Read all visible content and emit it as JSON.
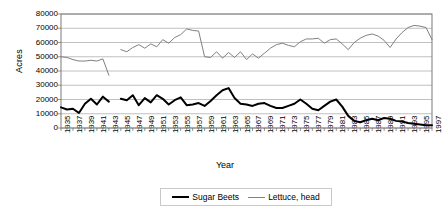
{
  "chart_data": {
    "type": "line",
    "title": "",
    "xlabel": "Year",
    "ylabel": "Acres",
    "ylim": [
      0,
      80000
    ],
    "ytick_values": [
      0,
      10000,
      20000,
      30000,
      40000,
      50000,
      60000,
      70000,
      80000
    ],
    "ytick_labels": [
      "0",
      "10000",
      "20000",
      "30000",
      "40000",
      "50000",
      "60000",
      "70000",
      "80000"
    ],
    "grid": true,
    "legend_position": "bottom",
    "x": [
      1935,
      1936,
      1937,
      1938,
      1939,
      1940,
      1941,
      1942,
      1943,
      1944,
      1945,
      1946,
      1947,
      1948,
      1949,
      1950,
      1951,
      1952,
      1953,
      1954,
      1955,
      1956,
      1957,
      1958,
      1959,
      1960,
      1961,
      1962,
      1963,
      1964,
      1965,
      1966,
      1967,
      1968,
      1969,
      1970,
      1971,
      1972,
      1973,
      1974,
      1975,
      1976,
      1977,
      1978,
      1979,
      1980,
      1981,
      1982,
      1983,
      1984,
      1985,
      1986,
      1987,
      1988,
      1989,
      1990,
      1991,
      1992,
      1993,
      1994,
      1995,
      1996,
      1997
    ],
    "xtick_labels": [
      "1935",
      "1937",
      "1939",
      "1941",
      "1943",
      "1945",
      "1947",
      "1949",
      "1951",
      "1953",
      "1955",
      "1957",
      "1959",
      "1961",
      "1963",
      "1965",
      "1967",
      "1969",
      "1971",
      "1973",
      "1975",
      "1977",
      "1979",
      "1981",
      "1983",
      "1985",
      "1987",
      "1989",
      "1991",
      "1993",
      "1995",
      "1997"
    ],
    "series": [
      {
        "name": "Sugar Beets",
        "color": "#000000",
        "width": 2,
        "values": [
          14500,
          13000,
          13500,
          10500,
          17000,
          20500,
          16500,
          22000,
          18500,
          null,
          20500,
          19500,
          23000,
          16000,
          21000,
          18000,
          23000,
          20500,
          16500,
          19500,
          21500,
          16000,
          16500,
          17500,
          15500,
          19000,
          23000,
          26500,
          28000,
          21000,
          17000,
          16500,
          15500,
          17000,
          17500,
          15500,
          14000,
          14000,
          15500,
          17000,
          20000,
          17000,
          13500,
          12500,
          15500,
          18500,
          20000,
          15000,
          8500,
          5000,
          4000,
          5500,
          6500,
          5500,
          7000,
          6500,
          5000,
          4500,
          3500,
          3000,
          2500,
          2000,
          2000
        ]
      },
      {
        "name": "Lettuce, head",
        "color": "#808080",
        "width": 1,
        "values": [
          50000,
          49500,
          48000,
          47000,
          47000,
          47500,
          47000,
          48500,
          37000,
          null,
          55000,
          53500,
          56500,
          58500,
          56000,
          59000,
          57000,
          62000,
          59500,
          63500,
          65500,
          69500,
          68500,
          68000,
          50000,
          49500,
          53500,
          49000,
          53000,
          49500,
          53500,
          48000,
          52000,
          49000,
          52500,
          56000,
          58500,
          59500,
          58000,
          57000,
          60500,
          62500,
          62500,
          63000,
          59500,
          62000,
          62500,
          59000,
          55000,
          60000,
          63000,
          65000,
          66000,
          64500,
          61500,
          56500,
          62500,
          67000,
          70500,
          72000,
          71500,
          70500,
          62000
        ]
      }
    ]
  },
  "axis": {
    "ylabel": "Acres",
    "xlabel": "Year"
  },
  "legend": {
    "entries": [
      {
        "label": "Sugar Beets"
      },
      {
        "label": "Lettuce, head"
      }
    ]
  }
}
